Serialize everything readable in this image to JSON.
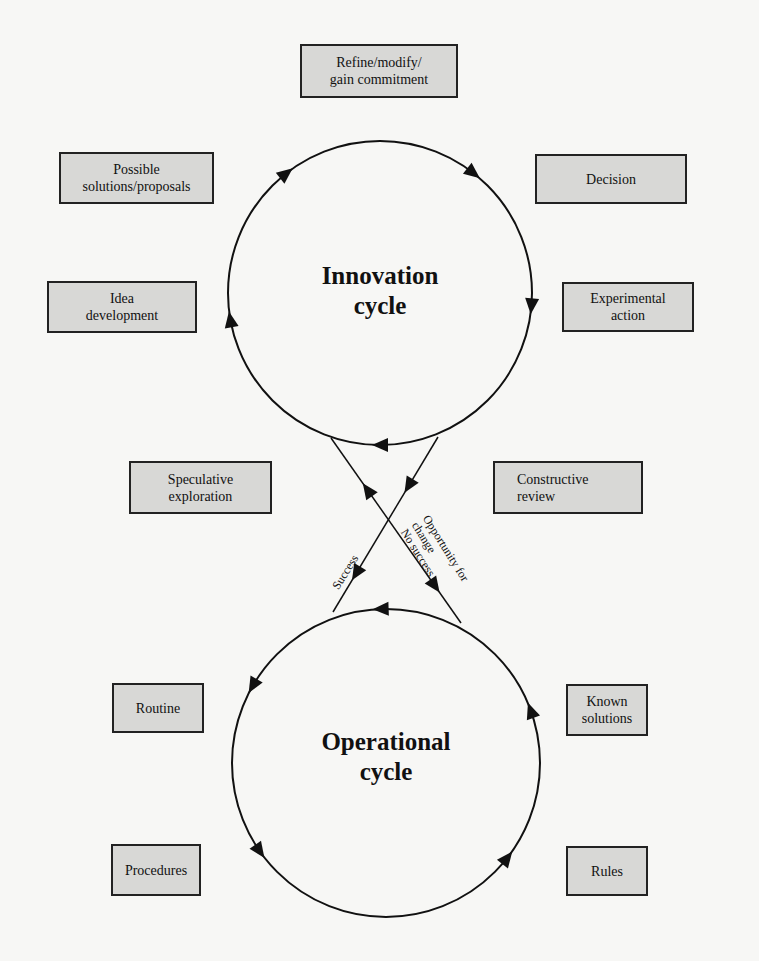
{
  "diagram": {
    "cycles": {
      "innovation": {
        "label": "Innovation\ncycle"
      },
      "operational": {
        "label": "Operational\ncycle"
      }
    },
    "boxes": {
      "refine": "Refine/modify/\ngain commitment",
      "possible_solutions": "Possible\nsolutions/proposals",
      "decision": "Decision",
      "idea_development": "Idea\ndevelopment",
      "experimental_action": "Experimental\naction",
      "speculative_exploration": "Speculative\nexploration",
      "constructive_review": "Constructive\nreview",
      "routine": "Routine",
      "known_solutions": "Known\nsolutions",
      "procedures": "Procedures",
      "rules": "Rules"
    },
    "edge_labels": {
      "success": "Success",
      "opportunity": "Opportunity for\nchange\nNo success"
    },
    "colors": {
      "box_fill": "#d8d8d6",
      "line": "#111111",
      "background": "#f7f7f5"
    }
  }
}
